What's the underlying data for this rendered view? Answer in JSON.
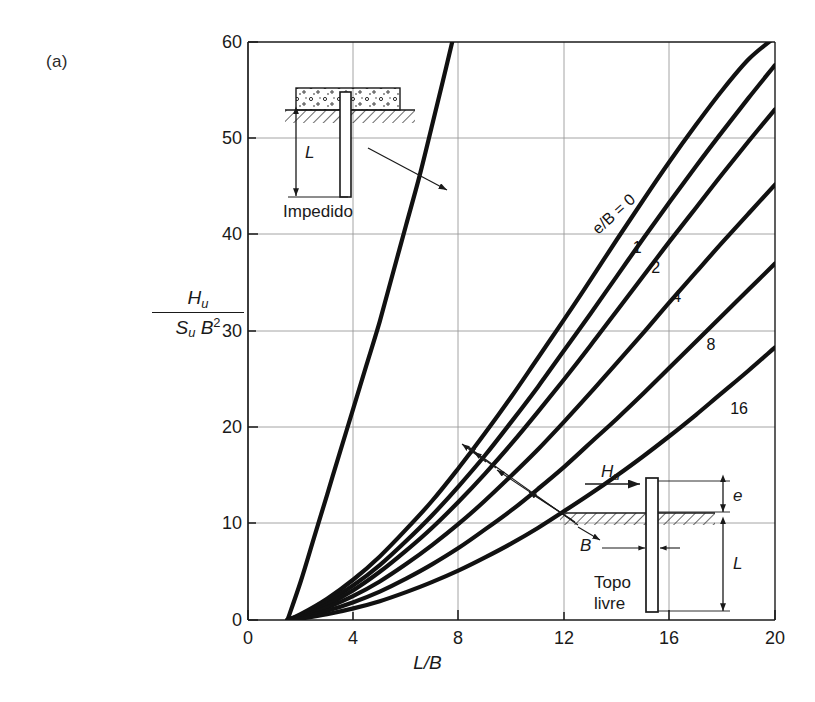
{
  "figure": {
    "panel_label": "(a)",
    "width": 815,
    "height": 702
  },
  "chart_data": {
    "type": "line",
    "title": "",
    "xlabel": "L/B",
    "ylabel": "Hu / (Su B^2)",
    "xlim": [
      0,
      20
    ],
    "ylim": [
      0,
      60
    ],
    "xticks": [
      0,
      4,
      8,
      12,
      16,
      20
    ],
    "yticks": [
      0,
      10,
      20,
      30,
      40,
      50,
      60
    ],
    "grid": true,
    "legend_position": "inline-curve-labels",
    "series": [
      {
        "name": "Impedido",
        "label": "Impedido",
        "note": "fixed-head pile, steep curve",
        "points": [
          [
            1.5,
            0
          ],
          [
            2,
            4
          ],
          [
            2.5,
            8.5
          ],
          [
            3,
            13
          ],
          [
            3.5,
            17.5
          ],
          [
            4,
            22
          ],
          [
            4.5,
            26.5
          ],
          [
            5,
            31
          ],
          [
            5.5,
            36
          ],
          [
            6,
            41
          ],
          [
            6.5,
            46
          ],
          [
            7,
            51.5
          ],
          [
            7.4,
            56
          ],
          [
            7.75,
            60
          ]
        ]
      },
      {
        "name": "e/B = 0",
        "label": "e/B = 0",
        "points": [
          [
            1.5,
            0
          ],
          [
            2,
            0.6
          ],
          [
            3,
            2.2
          ],
          [
            4,
            4.2
          ],
          [
            5,
            6.6
          ],
          [
            6,
            9.4
          ],
          [
            7,
            12.4
          ],
          [
            8,
            15.8
          ],
          [
            9,
            19.4
          ],
          [
            10,
            23.2
          ],
          [
            11,
            27.2
          ],
          [
            12,
            31.2
          ],
          [
            13,
            35.3
          ],
          [
            14,
            39.5
          ],
          [
            15,
            43.6
          ],
          [
            16,
            47.6
          ],
          [
            17,
            51.4
          ],
          [
            18,
            55.0
          ],
          [
            19,
            58.2
          ],
          [
            20,
            60.5
          ]
        ]
      },
      {
        "name": "1",
        "label": "1",
        "points": [
          [
            1.5,
            0
          ],
          [
            2,
            0.5
          ],
          [
            3,
            1.9
          ],
          [
            4,
            3.6
          ],
          [
            5,
            5.7
          ],
          [
            6,
            8.2
          ],
          [
            7,
            10.9
          ],
          [
            8,
            13.9
          ],
          [
            9,
            17.1
          ],
          [
            10,
            20.6
          ],
          [
            11,
            24.2
          ],
          [
            12,
            28.0
          ],
          [
            13,
            31.8
          ],
          [
            14,
            35.7
          ],
          [
            15,
            39.6
          ],
          [
            16,
            43.4
          ],
          [
            17,
            47.1
          ],
          [
            18,
            50.7
          ],
          [
            19,
            54.2
          ],
          [
            20,
            57.6
          ]
        ]
      },
      {
        "name": "2",
        "label": "2",
        "points": [
          [
            1.5,
            0
          ],
          [
            2,
            0.45
          ],
          [
            3,
            1.6
          ],
          [
            4,
            3.1
          ],
          [
            5,
            5.0
          ],
          [
            6,
            7.2
          ],
          [
            7,
            9.6
          ],
          [
            8,
            12.3
          ],
          [
            9,
            15.2
          ],
          [
            10,
            18.3
          ],
          [
            11,
            21.6
          ],
          [
            12,
            25.0
          ],
          [
            13,
            28.5
          ],
          [
            14,
            32.1
          ],
          [
            15,
            35.7
          ],
          [
            16,
            39.3
          ],
          [
            17,
            42.8
          ],
          [
            18,
            46.3
          ],
          [
            19,
            49.7
          ],
          [
            20,
            53.0
          ]
        ]
      },
      {
        "name": "4",
        "label": "4",
        "points": [
          [
            1.5,
            0
          ],
          [
            2,
            0.35
          ],
          [
            3,
            1.3
          ],
          [
            4,
            2.5
          ],
          [
            5,
            4.0
          ],
          [
            6,
            5.8
          ],
          [
            7,
            7.8
          ],
          [
            8,
            10.0
          ],
          [
            9,
            12.4
          ],
          [
            10,
            15.0
          ],
          [
            11,
            17.7
          ],
          [
            12,
            20.6
          ],
          [
            13,
            23.6
          ],
          [
            14,
            26.7
          ],
          [
            15,
            29.8
          ],
          [
            16,
            33.0
          ],
          [
            17,
            36.1
          ],
          [
            18,
            39.2
          ],
          [
            19,
            42.2
          ],
          [
            20,
            45.2
          ]
        ]
      },
      {
        "name": "8",
        "label": "8",
        "points": [
          [
            1.5,
            0
          ],
          [
            2,
            0.25
          ],
          [
            3,
            0.95
          ],
          [
            4,
            1.85
          ],
          [
            5,
            2.95
          ],
          [
            6,
            4.3
          ],
          [
            7,
            5.8
          ],
          [
            8,
            7.5
          ],
          [
            9,
            9.4
          ],
          [
            10,
            11.4
          ],
          [
            11,
            13.6
          ],
          [
            12,
            15.9
          ],
          [
            13,
            18.4
          ],
          [
            14,
            20.9
          ],
          [
            15,
            23.5
          ],
          [
            16,
            26.2
          ],
          [
            17,
            28.9
          ],
          [
            18,
            31.6
          ],
          [
            19,
            34.3
          ],
          [
            20,
            37.0
          ]
        ]
      },
      {
        "name": "16",
        "label": "16",
        "points": [
          [
            1.5,
            0
          ],
          [
            2,
            0.15
          ],
          [
            3,
            0.6
          ],
          [
            4,
            1.2
          ],
          [
            5,
            1.95
          ],
          [
            6,
            2.9
          ],
          [
            7,
            3.95
          ],
          [
            8,
            5.15
          ],
          [
            9,
            6.5
          ],
          [
            10,
            7.95
          ],
          [
            11,
            9.55
          ],
          [
            12,
            11.3
          ],
          [
            13,
            13.1
          ],
          [
            14,
            15.0
          ],
          [
            15,
            17.0
          ],
          [
            16,
            19.1
          ],
          [
            17,
            21.3
          ],
          [
            18,
            23.6
          ],
          [
            19,
            25.9
          ],
          [
            20,
            28.3
          ]
        ]
      }
    ],
    "curve_labels": [
      {
        "text": "e/B = 0",
        "x": 13.4,
        "y": 41.5
      },
      {
        "text": "1",
        "x": 14.6,
        "y": 39.5
      },
      {
        "text": "2",
        "x": 15.3,
        "y": 37.5
      },
      {
        "text": "4",
        "x": 16.1,
        "y": 34.5
      },
      {
        "text": "8",
        "x": 17.4,
        "y": 29.5
      },
      {
        "text": "16",
        "x": 18.3,
        "y": 22.8
      }
    ]
  },
  "insets": {
    "fixed_head": {
      "caption": "Impedido",
      "length_label": "L"
    },
    "free_head": {
      "caption_line1": "Topo",
      "caption_line2": "livre",
      "force_label": "Hu",
      "eccentricity_label": "e",
      "width_label": "B",
      "length_label": "L"
    }
  },
  "axes": {
    "x": {
      "label": "L/B",
      "ticks": [
        "0",
        "4",
        "8",
        "12",
        "16",
        "20"
      ]
    },
    "y": {
      "label_numerator": "Hu",
      "label_denominator": "Su B2",
      "ticks": [
        "0",
        "10",
        "20",
        "30",
        "40",
        "50",
        "60"
      ]
    }
  },
  "colors": {
    "curve": "#111111",
    "grid": "#9a9a9a",
    "axis": "#1a1a1a",
    "background": "#ffffff",
    "hatch": "#1a1a1a"
  }
}
